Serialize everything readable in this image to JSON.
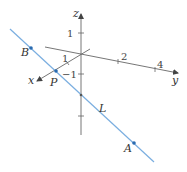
{
  "diagram": {
    "type": "3d-coordinate-line",
    "colors": {
      "axis": "#555555",
      "line": "#7aaee0",
      "point": "#2a6bb0",
      "text": "#333333"
    },
    "axes": {
      "x": {
        "label": "x",
        "ticks": [
          "1"
        ]
      },
      "y": {
        "label": "y",
        "ticks": [
          "2",
          "4"
        ]
      },
      "z": {
        "label": "z",
        "ticks": [
          "1",
          "−1"
        ]
      }
    },
    "line": {
      "label": "L"
    },
    "points": [
      {
        "name": "B",
        "label": "B"
      },
      {
        "name": "P",
        "label": "P"
      },
      {
        "name": "A",
        "label": "A"
      }
    ]
  }
}
